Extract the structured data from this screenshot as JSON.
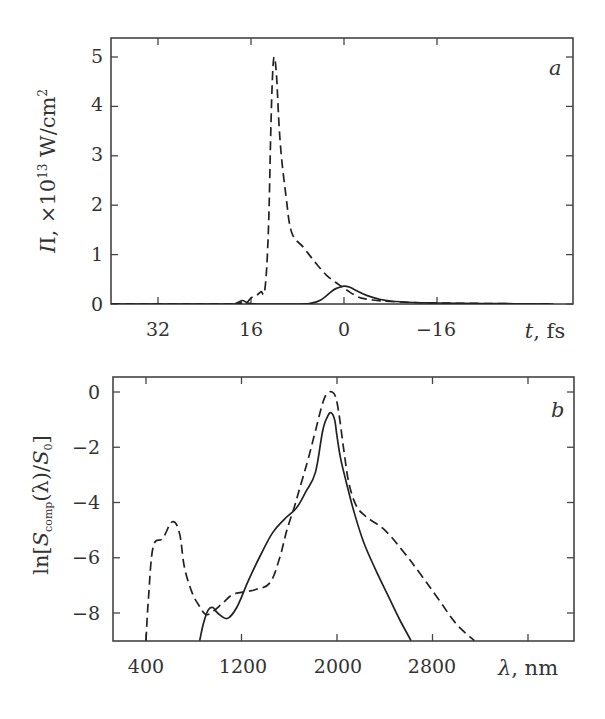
{
  "chart_data": [
    {
      "panel": "a",
      "type": "line",
      "title": "",
      "panel_label": "a",
      "xlabel": "t, fs",
      "ylabel": "I, ×10^13 W/cm^2",
      "xlim": [
        40,
        -36
      ],
      "ylim": [
        0,
        5.2
      ],
      "x_reversed": true,
      "xticks": [
        32,
        16,
        0,
        -16
      ],
      "xtick_labels": [
        "32",
        "16",
        "0",
        "−16"
      ],
      "yticks": [
        0,
        1,
        2,
        3,
        4,
        5
      ],
      "ytick_labels": [
        "0",
        "1",
        "2",
        "3",
        "4",
        "5"
      ],
      "grid": false,
      "legend": null,
      "series": [
        {
          "name": "dashed",
          "style": "dashed",
          "x": [
            40,
            20,
            18,
            17.3,
            16.8,
            16,
            15,
            14.3,
            13.6,
            13,
            12.6,
            12.3,
            12,
            11.6,
            11,
            10,
            9,
            7,
            5,
            3,
            1,
            0,
            -1,
            -2,
            -3,
            -5,
            -8,
            -12,
            -16,
            -24,
            -36
          ],
          "y": [
            0,
            0,
            0.02,
            0.06,
            0.02,
            0.12,
            0.18,
            0.25,
            0.3,
            1.5,
            3.5,
            4.6,
            5.0,
            4.6,
            3.3,
            2.2,
            1.45,
            1.15,
            0.85,
            0.58,
            0.4,
            0.32,
            0.24,
            0.17,
            0.12,
            0.08,
            0.05,
            0.03,
            0.02,
            0.01,
            0
          ]
        },
        {
          "name": "solid",
          "style": "solid",
          "x": [
            40,
            20,
            18.5,
            17.5,
            16.5,
            15,
            10,
            6,
            4,
            2,
            1,
            0,
            -1,
            -2,
            -4,
            -6,
            -8,
            -12,
            -16,
            -24,
            -36
          ],
          "y": [
            0,
            0,
            0.02,
            0.07,
            0.02,
            0,
            0,
            0.01,
            0.08,
            0.27,
            0.33,
            0.36,
            0.34,
            0.28,
            0.17,
            0.1,
            0.06,
            0.03,
            0.02,
            0.01,
            0
          ]
        }
      ]
    },
    {
      "panel": "b",
      "type": "line",
      "title": "",
      "panel_label": "b",
      "xlabel": "λ, nm",
      "ylabel": "ln[S_comp(λ)/S_0]",
      "xlim": [
        125,
        3750
      ],
      "ylim": [
        -9,
        0.4
      ],
      "xticks": [
        400,
        1200,
        2000,
        2800,
        3600
      ],
      "xtick_labels": [
        "400",
        "1200",
        "2000",
        "2800",
        ""
      ],
      "yticks": [
        0,
        -2,
        -4,
        -6,
        -8
      ],
      "ytick_labels": [
        "0",
        "−2",
        "−4",
        "−6",
        "−8"
      ],
      "grid": false,
      "legend": null,
      "series": [
        {
          "name": "dashed",
          "style": "dashed",
          "x": [
            400,
            420,
            460,
            540,
            620,
            680,
            720,
            780,
            840,
            900,
            960,
            1040,
            1120,
            1200,
            1320,
            1440,
            1520,
            1580,
            1640,
            1700,
            1760,
            1820,
            1880,
            1920,
            1960,
            1990,
            2020,
            2060,
            2100,
            2160,
            2240,
            2400,
            2560,
            2700,
            2850,
            3000,
            3150
          ],
          "y": [
            -9,
            -7.5,
            -5.6,
            -5.3,
            -4.7,
            -5.1,
            -6.3,
            -7.2,
            -7.7,
            -8.05,
            -7.95,
            -7.65,
            -7.35,
            -7.25,
            -7.15,
            -6.9,
            -6.0,
            -5.0,
            -4.2,
            -3.3,
            -2.4,
            -1.4,
            -0.4,
            -0.05,
            0.0,
            -0.2,
            -0.9,
            -2.2,
            -3.3,
            -4.1,
            -4.5,
            -5.0,
            -5.8,
            -6.6,
            -7.5,
            -8.4,
            -9
          ]
        },
        {
          "name": "solid",
          "style": "solid",
          "x": [
            850,
            880,
            920,
            960,
            1000,
            1080,
            1160,
            1260,
            1360,
            1460,
            1560,
            1660,
            1740,
            1820,
            1880,
            1920,
            1950,
            1980,
            2000,
            2030,
            2080,
            2140,
            2220,
            2320,
            2420,
            2520,
            2620
          ],
          "y": [
            -9,
            -8.4,
            -7.9,
            -7.8,
            -8.0,
            -8.2,
            -7.8,
            -6.8,
            -5.9,
            -5.1,
            -4.6,
            -4.2,
            -3.6,
            -2.9,
            -1.4,
            -0.9,
            -0.75,
            -1.0,
            -1.6,
            -2.4,
            -3.3,
            -4.3,
            -5.4,
            -6.4,
            -7.3,
            -8.2,
            -9
          ]
        }
      ]
    }
  ],
  "panel_a": {
    "tag": "a",
    "ylabel_main": "I, ×10",
    "ylabel_exp": "13",
    "ylabel_unit": " W/cm",
    "ylabel_unit_exp": "2",
    "xlabel_var": "t",
    "xlabel_unit": ", fs",
    "yticks": [
      "0",
      "1",
      "2",
      "3",
      "4",
      "5"
    ],
    "xticks": [
      "32",
      "16",
      "0",
      "−16"
    ]
  },
  "panel_b": {
    "tag": "b",
    "ylabel_pre": "ln[",
    "ylabel_S": "S",
    "ylabel_sub": "comp",
    "ylabel_mid": "(λ)/",
    "ylabel_S0": "S",
    "ylabel_sub0": "0",
    "ylabel_post": "]",
    "xlabel_var": "λ",
    "xlabel_unit": ", nm",
    "yticks": [
      "0",
      "−2",
      "−4",
      "−6",
      "−8"
    ],
    "xticks": [
      "400",
      "1200",
      "2000",
      "2800"
    ]
  }
}
